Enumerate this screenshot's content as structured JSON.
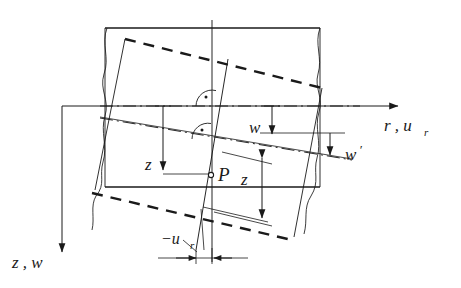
{
  "figure": {
    "type": "engineering-diagram",
    "width": 461,
    "height": 288,
    "background_color": "#ffffff",
    "line_color": "#1a1a1a"
  },
  "axes": {
    "horizontal": {
      "label": "r , u",
      "label_sub": "r",
      "name": "radial-axis",
      "direction": "right",
      "origin": {
        "x": 62,
        "y": 106
      },
      "tip": {
        "x": 404,
        "y": 106
      }
    },
    "vertical": {
      "label": "z , w",
      "name": "axial-axis",
      "direction": "down",
      "origin": {
        "x": 62,
        "y": 106
      },
      "tip": {
        "x": 62,
        "y": 258
      }
    }
  },
  "labels": {
    "r_axis": "r , u",
    "r_axis_sub": "r",
    "z_axis": "z , w",
    "w": "w",
    "w_prime": "w",
    "w_prime_mark": "′",
    "z_left": "z",
    "z_right": "z",
    "point_p": "P",
    "u_r": "−u",
    "u_r_sub": "r"
  },
  "geometry": {
    "undeformed_rect": {
      "name": "undeformed-cross-section",
      "style": "solid",
      "left": 105,
      "right": 320,
      "top": 28,
      "bottom": 187
    },
    "deformed_outline": {
      "name": "deformed-cross-section",
      "style": "dashed",
      "top_line": {
        "x1": 125,
        "y1": 39,
        "x2": 322,
        "y2": 88
      },
      "bottom_line": {
        "x1": 92,
        "y1": 193,
        "x2": 292,
        "y2": 240
      }
    },
    "midsurface_undeformed": {
      "name": "undeformed-midsurface-centerline",
      "style": "dash-dot",
      "y": 106,
      "x1": 100,
      "x2": 360
    },
    "midsurface_deformed": {
      "name": "deformed-midsurface-centerline",
      "style": "dash-dot",
      "x1": 100,
      "y1": 118,
      "x2": 352,
      "y2": 160
    },
    "normal_undeformed": {
      "name": "undeformed-normal-line",
      "style": "solid",
      "x": 212,
      "y1": 20,
      "y2": 262
    },
    "normal_deformed": {
      "name": "rotated-normal-line",
      "style": "solid",
      "x1": 228,
      "y1": 59,
      "x2": 196,
      "y2": 250
    },
    "right_angle_markers": [
      {
        "name": "right-angle-marker-top",
        "cx": 212,
        "cy": 106,
        "r": 16
      },
      {
        "name": "right-angle-marker-bottom",
        "cx": 208,
        "cy": 139,
        "r": 16
      }
    ],
    "point_p_marker": {
      "name": "point-p-marker",
      "cx": 211,
      "cy": 175,
      "r": 2.6
    }
  },
  "dimensions": [
    {
      "name": "dimension-w",
      "label": "w",
      "orientation": "vertical-down",
      "x": 272,
      "y_from": 106,
      "y_to": 140,
      "label_x": 249,
      "label_y": 131
    },
    {
      "name": "dimension-w-prime",
      "label": "w'",
      "orientation": "vertical-down",
      "x": 330,
      "y_from": 133,
      "y_to": 160,
      "label_x": 345,
      "label_y": 157
    },
    {
      "name": "dimension-z-left",
      "label": "z",
      "orientation": "vertical-down",
      "x": 163,
      "y_from": 106,
      "y_to": 174,
      "label_x": 147,
      "label_y": 166
    },
    {
      "name": "dimension-z-right",
      "label": "z",
      "orientation": "vertical-double",
      "x": 262,
      "y_from": 152,
      "y_to": 222,
      "label_x": 243,
      "label_y": 182
    },
    {
      "name": "dimension-u-r",
      "label": "−u_r",
      "orientation": "horizontal-inward",
      "y": 258,
      "x_from": 174,
      "x_to": 232,
      "label_x": 176,
      "label_y": 243
    }
  ],
  "break_lines": [
    {
      "name": "break-line-left",
      "side": "left"
    },
    {
      "name": "break-line-right",
      "side": "right"
    }
  ]
}
